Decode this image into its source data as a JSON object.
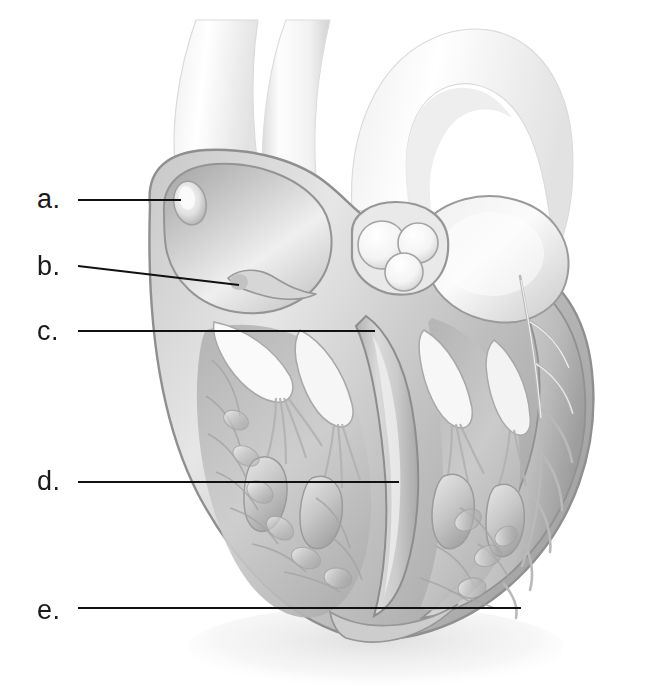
{
  "figure": {
    "background_color": "#ffffff",
    "width": 646,
    "height": 697,
    "style": "grayscale-pencil-medical-illustration"
  },
  "labels": [
    {
      "id": "a",
      "text": "a.",
      "text_x": 37,
      "text_y": 186,
      "leader": {
        "x1": 78,
        "y1": 200,
        "x2": 181,
        "y2": 200
      },
      "points_to": "fossa-ovalis-right-atrium"
    },
    {
      "id": "b",
      "text": "b.",
      "text_x": 37,
      "text_y": 253,
      "leader": {
        "x1": 78,
        "y1": 266,
        "x2": 239,
        "y2": 285
      },
      "points_to": "coronary-sinus-opening"
    },
    {
      "id": "c",
      "text": "c.",
      "text_x": 37,
      "text_y": 318,
      "leader": {
        "x1": 78,
        "y1": 331,
        "x2": 375,
        "y2": 331
      },
      "points_to": "interventricular-septum-upper"
    },
    {
      "id": "d",
      "text": "d.",
      "text_x": 37,
      "text_y": 468,
      "leader": {
        "x1": 78,
        "y1": 482,
        "x2": 399,
        "y2": 482
      },
      "points_to": "interventricular-septum-lower"
    },
    {
      "id": "e",
      "text": "e.",
      "text_x": 37,
      "text_y": 597,
      "leader": {
        "x1": 78,
        "y1": 608,
        "x2": 521,
        "y2": 608
      },
      "points_to": "myocardium-apex"
    }
  ],
  "leader_line": {
    "color": "#111111",
    "width": 2
  },
  "illustration_colors": {
    "outline": "#8e8e8e",
    "wall_mid": "#b9b9b9",
    "wall_light": "#dedede",
    "wall_dark": "#9a9a9a",
    "chamber_fill": "#cfcfcf",
    "vessel_pale": "#f2f2f2",
    "highlight": "#ffffff",
    "shadow": "#7d7d7d"
  },
  "anatomy_parts": [
    {
      "name": "superior-vena-cava",
      "region": "upper-left-vessel"
    },
    {
      "name": "aorta-arch",
      "region": "upper-right-vessel"
    },
    {
      "name": "pulmonary-trunk",
      "region": "upper-middle-vessel"
    },
    {
      "name": "right-atrium",
      "region": "left-upper-chamber"
    },
    {
      "name": "fossa-ovalis",
      "region": "right-atrium-wall"
    },
    {
      "name": "coronary-sinus-opening",
      "region": "right-atrium-floor"
    },
    {
      "name": "semilunar-valve-cusps",
      "region": "center-valve"
    },
    {
      "name": "left-atrium",
      "region": "right-upper-chamber"
    },
    {
      "name": "tricuspid-valve",
      "region": "left-mid"
    },
    {
      "name": "mitral-valve",
      "region": "right-mid"
    },
    {
      "name": "chordae-tendineae",
      "region": "ventricles"
    },
    {
      "name": "papillary-muscles",
      "region": "ventricles"
    },
    {
      "name": "trabeculae-carneae",
      "region": "ventricle-walls"
    },
    {
      "name": "right-ventricle",
      "region": "left-lower-chamber"
    },
    {
      "name": "left-ventricle",
      "region": "right-lower-chamber"
    },
    {
      "name": "interventricular-septum",
      "region": "center-lower"
    },
    {
      "name": "myocardium",
      "region": "outer-wall"
    },
    {
      "name": "apex",
      "region": "bottom-center"
    }
  ]
}
